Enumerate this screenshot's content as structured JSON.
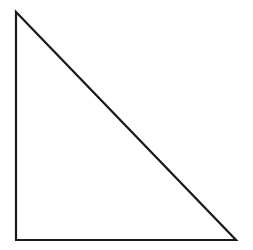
{
  "canvas": {
    "width": 253,
    "height": 250,
    "background_color": "#ffffff"
  },
  "figure": {
    "name": "right-triangle",
    "stroke_color": "#1a1a1a",
    "stroke_width": 2.2,
    "fill_color": "none",
    "right_angle_vertex": "bottom-left",
    "vertices": [
      {
        "label": "apex",
        "x": 16,
        "y": 12
      },
      {
        "label": "bottom-left",
        "x": 16,
        "y": 240
      },
      {
        "label": "bottom-right",
        "x": 236,
        "y": 240
      }
    ],
    "points_attr": "16,12 16,240 236,240",
    "edges": [
      {
        "name": "vertical-leg",
        "from": "apex",
        "to": "bottom-left",
        "length": 228
      },
      {
        "name": "horizontal-leg",
        "from": "bottom-left",
        "to": "bottom-right",
        "length": 220
      },
      {
        "name": "hypotenuse",
        "from": "bottom-right",
        "to": "apex",
        "length": 317
      }
    ]
  }
}
